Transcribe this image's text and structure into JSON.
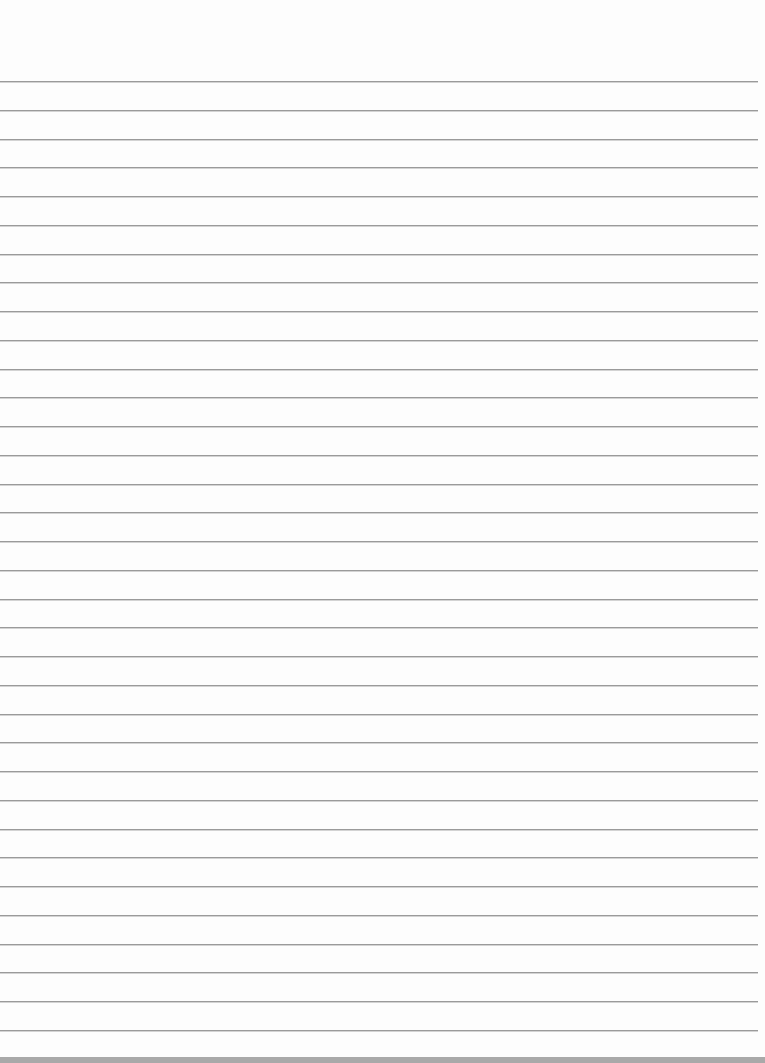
{
  "page": {
    "type": "blank lined paper",
    "width": 765,
    "height": 1063
  },
  "ruling": {
    "first_line_y": 81,
    "line_spacing": 28.75,
    "line_count": 34,
    "line_length": 758,
    "line_color": "#9a9a9a"
  },
  "colors": {
    "paper": "#fdfdfd",
    "bottom_strip": "#a9a9a9"
  }
}
